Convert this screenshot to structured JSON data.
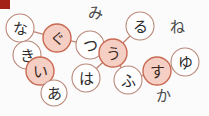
{
  "canvas": {
    "width": 209,
    "height": 116,
    "background": "#fbfbfb"
  },
  "theme": {
    "node_fill_selected": "#f6cfc4",
    "node_fill_plain": "#ffffff",
    "node_stroke_selected": "#c96a52",
    "node_stroke_plain": "#b98878",
    "edge_color": "#c08273",
    "label_color_selected": "#3a2a22",
    "label_color_plain": "#2b2b2b",
    "free_label_color": "#4a4a4a",
    "corner_marker_color": "#a32116"
  },
  "corner_marker": {
    "name": "corner-marker",
    "x": 0,
    "y": 0,
    "width": 10,
    "height": 9,
    "color": "#a32116"
  },
  "nodes": [
    {
      "id": "na",
      "label": "な",
      "x": 20,
      "y": 28,
      "r": 14,
      "state": "plain"
    },
    {
      "id": "ki",
      "label": "き",
      "x": 27,
      "y": 55,
      "r": 14,
      "state": "plain"
    },
    {
      "id": "gu",
      "label": "ぐ",
      "x": 57,
      "y": 38,
      "r": 14,
      "state": "selected"
    },
    {
      "id": "i",
      "label": "い",
      "x": 40,
      "y": 71,
      "r": 14,
      "state": "selected"
    },
    {
      "id": "a",
      "label": "あ",
      "x": 54,
      "y": 93,
      "r": 13,
      "state": "plain"
    },
    {
      "id": "tsu",
      "label": "つ",
      "x": 90,
      "y": 45,
      "r": 14,
      "state": "plain"
    },
    {
      "id": "ha",
      "label": "は",
      "x": 86,
      "y": 78,
      "r": 14,
      "state": "plain"
    },
    {
      "id": "u",
      "label": "う",
      "x": 113,
      "y": 53,
      "r": 14,
      "state": "selected"
    },
    {
      "id": "ru",
      "label": "る",
      "x": 140,
      "y": 26,
      "r": 14,
      "state": "plain"
    },
    {
      "id": "fu",
      "label": "ふ",
      "x": 128,
      "y": 80,
      "r": 14,
      "state": "plain"
    },
    {
      "id": "su",
      "label": "す",
      "x": 157,
      "y": 71,
      "r": 14,
      "state": "selected"
    },
    {
      "id": "yu",
      "label": "ゆ",
      "x": 185,
      "y": 62,
      "r": 14,
      "state": "plain"
    }
  ],
  "edges": [
    {
      "from": "na",
      "to": "gu"
    },
    {
      "from": "gu",
      "to": "tsu"
    },
    {
      "from": "tsu",
      "to": "u"
    },
    {
      "from": "u",
      "to": "ru"
    },
    {
      "from": "u",
      "to": "ha"
    },
    {
      "from": "u",
      "to": "fu"
    },
    {
      "from": "fu",
      "to": "su"
    },
    {
      "from": "su",
      "to": "yu"
    },
    {
      "from": "ki",
      "to": "i"
    },
    {
      "from": "i",
      "to": "a"
    }
  ],
  "free_labels": [
    {
      "id": "mi",
      "label": "み",
      "x": 95,
      "y": 13
    },
    {
      "id": "ne",
      "label": "ね",
      "x": 177,
      "y": 27
    },
    {
      "id": "ka",
      "label": "か",
      "x": 163,
      "y": 96
    }
  ]
}
